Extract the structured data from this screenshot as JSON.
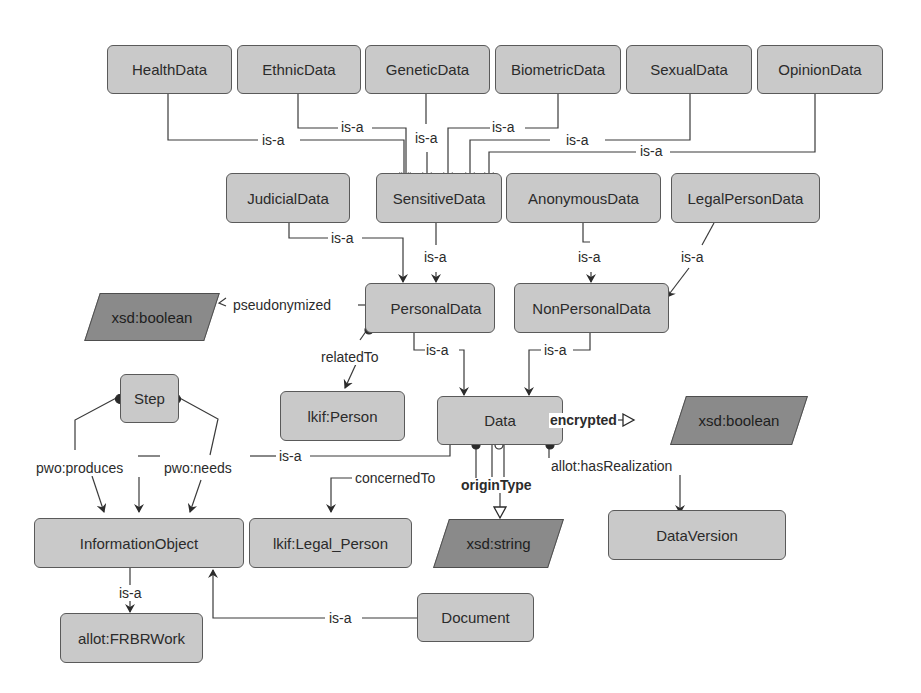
{
  "nodes": {
    "health": "HealthData",
    "ethnic": "EthnicData",
    "genetic": "GeneticData",
    "biometric": "BiometricData",
    "sexual": "SexualData",
    "opinion": "OpinionData",
    "judicial": "JudicialData",
    "sensitive": "SensitiveData",
    "anonymous": "AnonymousData",
    "legalperson": "LegalPersonData",
    "personal": "PersonalData",
    "nonpersonal": "NonPersonalData",
    "step": "Step",
    "lkifperson": "lkif:Person",
    "data": "Data",
    "informationobject": "InformationObject",
    "lkiflegalperson": "lkif:Legal_Person",
    "dataversion": "DataVersion",
    "frbrwork": "allot:FRBRWork",
    "document": "Document"
  },
  "datatypes": {
    "bool1": "xsd:boolean",
    "bool2": "xsd:boolean",
    "string": "xsd:string"
  },
  "edge_labels": {
    "isa_health": "is-a",
    "isa_ethnic": "is-a",
    "isa_genetic": "is-a",
    "isa_biometric": "is-a",
    "isa_sexual": "is-a",
    "isa_opinion": "is-a",
    "isa_judicial": "is-a",
    "isa_sensitive": "is-a",
    "isa_anonymous": "is-a",
    "isa_legalperson": "is-a",
    "isa_personal": "is-a",
    "isa_nonpersonal": "is-a",
    "isa_infoobj_data": "is-a",
    "isa_frbr": "is-a",
    "isa_document": "is-a",
    "pseudonymized": "pseudonymized",
    "relatedTo": "relatedTo",
    "encrypted": "encrypted",
    "originType": "originType",
    "concernedTo": "concernedTo",
    "hasRealization": "allot:hasRealization",
    "produces": "pwo:produces",
    "needs": "pwo:needs"
  },
  "colors": {
    "class_fill": "#c9c9c9",
    "datatype_fill": "#8a8a8a",
    "stroke": "#5a5a5a",
    "edge": "#3a3a3a"
  }
}
